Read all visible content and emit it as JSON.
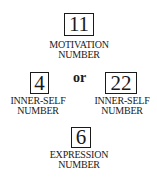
{
  "diagram": {
    "motivation": {
      "value": "11",
      "label_line1": "MOTIVATION",
      "label_line2": "NUMBER"
    },
    "connector": "or",
    "inner_self_left": {
      "value": "4",
      "label_line1": "INNER-SELF",
      "label_line2": "NUMBER"
    },
    "inner_self_right": {
      "value": "22",
      "label_line1": "INNER-SELF",
      "label_line2": "NUMBER"
    },
    "expression": {
      "value": "6",
      "label_line1": "EXPRESSION",
      "label_line2": "NUMBER"
    }
  }
}
